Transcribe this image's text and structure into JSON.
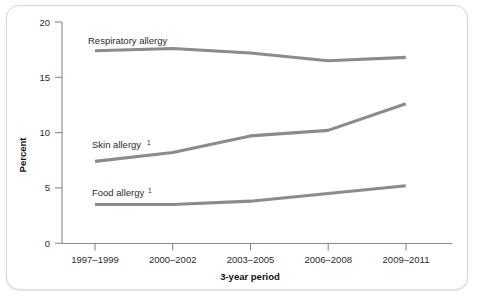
{
  "chart_data": {
    "type": "line",
    "title": "",
    "xlabel": "3-year period",
    "ylabel": "Percent",
    "categories": [
      "1997–1999",
      "2000–2002",
      "2003–2005",
      "2006–2008",
      "2009–2011"
    ],
    "ylim": [
      0,
      20
    ],
    "yticks": [
      0,
      5,
      10,
      15,
      20
    ],
    "ytick_labels": [
      "0",
      "5",
      "10",
      "15",
      "20"
    ],
    "grid": false,
    "legend": "inline-labels",
    "series": [
      {
        "name": "Respiratory allergy",
        "label": "Respiratory allergy",
        "footnote": "",
        "color": "#8b8b8b",
        "values": [
          17.4,
          17.6,
          17.2,
          16.5,
          16.8
        ]
      },
      {
        "name": "Skin allergy",
        "label": "Skin allergy",
        "footnote": "1",
        "color": "#8b8b8b",
        "values": [
          7.4,
          8.2,
          9.7,
          10.2,
          12.6
        ]
      },
      {
        "name": "Food allergy",
        "label": "Food allergy",
        "footnote": "1",
        "color": "#8b8b8b",
        "values": [
          3.5,
          3.5,
          3.8,
          4.5,
          5.2
        ]
      }
    ]
  },
  "axis": {
    "y_title": "Percent",
    "x_title": "3-year period",
    "y_tick_0": "0",
    "y_tick_1": "5",
    "y_tick_2": "10",
    "y_tick_3": "15",
    "y_tick_4": "20",
    "x_tick_0": "1997–1999",
    "x_tick_1": "2000–2002",
    "x_tick_2": "2003–2005",
    "x_tick_3": "2006–2008",
    "x_tick_4": "2009–2011"
  },
  "labels": {
    "respiratory": "Respiratory allergy",
    "skin": "Skin allergy",
    "skin_footnote": "1",
    "food": "Food allergy",
    "food_footnote": "1"
  }
}
